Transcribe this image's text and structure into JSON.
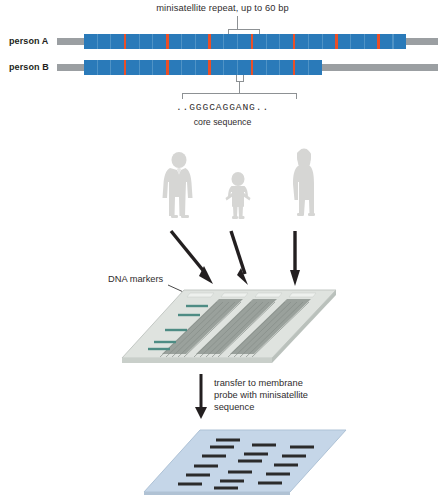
{
  "figure": {
    "background": "#ffffff"
  },
  "colors": {
    "repeat_blue": "#2a7ab9",
    "core_red": "#ea4f27",
    "flank_grey": "#9b9fa2",
    "bracket_grey": "#8d9194",
    "text": "#2f2c2d",
    "gel_body": "#d8ddd9",
    "gel_lane_dark": "#8e9491",
    "marker_band": "#4e8c84",
    "membrane": "#c3d4e6",
    "membrane_band": "#2b2b2b",
    "arrow": "#231f20",
    "person_grey": "#b9b9b6"
  },
  "panel_dna": {
    "top_caption": "minisatellite repeat, up to 60 bp",
    "rows": [
      {
        "label": "person A",
        "repeat_count": 23,
        "flank_left": true,
        "flank_right": true
      },
      {
        "label": "person B",
        "repeat_count": 17,
        "flank_left": true,
        "flank_right": true
      }
    ],
    "core_sequence": "..GGGCAGGANG..",
    "core_sequence_label": "core sequence"
  },
  "panel_people": {
    "figures": [
      {
        "name": "adult-man",
        "label": ""
      },
      {
        "name": "child",
        "label": ""
      },
      {
        "name": "adult-woman",
        "label": ""
      }
    ],
    "arrows": 3
  },
  "panel_gel": {
    "markers_label": "DNA markers",
    "marker_band_count": 5,
    "sample_lane_count": 3
  },
  "panel_transfer": {
    "text": "transfer to membrane\nprobe with minisatellite\nsequence"
  },
  "panel_membrane": {
    "lane_count": 3,
    "band_rows": 6
  },
  "chart_data": {
    "type": "diagram",
    "steps": [
      "Compare minisatellite repeat arrays between person A and person B",
      "Collect DNA samples from three individuals",
      "Separate fragments by gel electrophoresis alongside DNA markers",
      "Transfer to membrane and probe with minisatellite sequence",
      "Read resulting DNA fingerprint banding pattern"
    ],
    "person_a_repeats": 23,
    "person_b_repeats": 17,
    "repeat_length_bp_max": 60,
    "core_sequence": "..GGGCAGGANG.."
  }
}
